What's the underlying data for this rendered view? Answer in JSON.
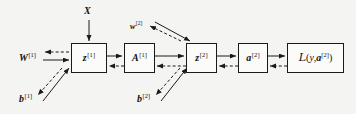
{
  "diagram": {
    "type": "computation-graph",
    "background_color": "#f4f4f2",
    "stroke_color": "#1a1a1a",
    "nodes": [
      {
        "id": "z1",
        "text": "z",
        "superscript": "[1]",
        "x": 71,
        "y": 43,
        "w": 36,
        "h": 30
      },
      {
        "id": "A1",
        "text": "A",
        "superscript": "[1]",
        "x": 124,
        "y": 43,
        "w": 31,
        "h": 30
      },
      {
        "id": "z2",
        "text": "z",
        "superscript": "[2]",
        "x": 186,
        "y": 43,
        "w": 31,
        "h": 30
      },
      {
        "id": "a2",
        "text": "a",
        "superscript": "[2]",
        "x": 238,
        "y": 43,
        "w": 30,
        "h": 30
      },
      {
        "id": "loss",
        "text": "L(y, a[2])",
        "superscript": "",
        "x": 287,
        "y": 43,
        "w": 57,
        "h": 30
      }
    ],
    "loss_parts": {
      "script_l": "L",
      "open_paren": "(",
      "y": "y",
      "comma": ",",
      "a": "a",
      "a_superscript": "[2]",
      "close_paren": ")"
    },
    "labels": [
      {
        "id": "X",
        "text": "X",
        "superscript": "",
        "x": 84,
        "y": 6,
        "size": "normal"
      },
      {
        "id": "w2",
        "text": "w",
        "superscript": "[2]",
        "x": 130,
        "y": 21,
        "size": "small"
      },
      {
        "id": "W1",
        "text": "W",
        "superscript": "[1]",
        "x": 19,
        "y": 52,
        "size": "normal"
      },
      {
        "id": "b1",
        "text": "b",
        "superscript": "[1]",
        "x": 19,
        "y": 93,
        "size": "normal"
      },
      {
        "id": "b2",
        "text": "b",
        "superscript": "[2]",
        "x": 137,
        "y": 93,
        "size": "normal"
      }
    ],
    "edges": [
      {
        "id": "X-to-z1",
        "style": "solid",
        "direction": "down",
        "from": "X",
        "to": "z1"
      },
      {
        "id": "W1-to-z1",
        "style": "solid",
        "direction": "right",
        "from": "W1",
        "to": "z1"
      },
      {
        "id": "z1-to-W1",
        "style": "dashed",
        "direction": "left",
        "from": "z1",
        "to": "W1"
      },
      {
        "id": "b1-to-z1",
        "style": "solid",
        "direction": "up",
        "from": "b1",
        "to": "z1"
      },
      {
        "id": "z1-to-b1",
        "style": "dashed",
        "direction": "down",
        "from": "z1",
        "to": "b1"
      },
      {
        "id": "z1-to-A1",
        "style": "solid",
        "direction": "right",
        "from": "z1",
        "to": "A1"
      },
      {
        "id": "A1-to-z1",
        "style": "dashed",
        "direction": "left",
        "from": "A1",
        "to": "z1"
      },
      {
        "id": "A1-to-z2",
        "style": "solid",
        "direction": "right",
        "from": "A1",
        "to": "z2"
      },
      {
        "id": "z2-to-A1",
        "style": "dashed",
        "direction": "left",
        "from": "z2",
        "to": "A1"
      },
      {
        "id": "w2-to-z2",
        "style": "solid",
        "direction": "down",
        "from": "w2",
        "to": "z2"
      },
      {
        "id": "z2-to-w2",
        "style": "dashed",
        "direction": "up",
        "from": "z2",
        "to": "w2"
      },
      {
        "id": "b2-to-z2",
        "style": "solid",
        "direction": "up",
        "from": "b2",
        "to": "z2"
      },
      {
        "id": "z2-to-b2",
        "style": "dashed",
        "direction": "down",
        "from": "z2",
        "to": "b2"
      },
      {
        "id": "z2-to-a2",
        "style": "solid",
        "direction": "right",
        "from": "z2",
        "to": "a2"
      },
      {
        "id": "a2-to-z2",
        "style": "dashed",
        "direction": "left",
        "from": "a2",
        "to": "z2"
      },
      {
        "id": "a2-to-loss",
        "style": "solid",
        "direction": "right",
        "from": "a2",
        "to": "loss"
      },
      {
        "id": "loss-to-a2",
        "style": "dashed",
        "direction": "left",
        "from": "loss",
        "to": "a2"
      }
    ]
  }
}
